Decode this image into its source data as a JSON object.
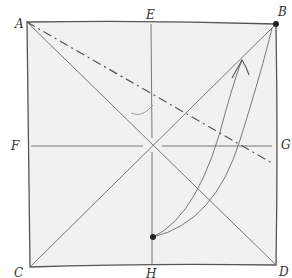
{
  "diagram": {
    "type": "origami-fold-diagram",
    "style": "hand-drawn pencil",
    "colors": {
      "paper_fill": "#f1f1f1",
      "paper_edge": "#555555",
      "crease": "#6a6a6a",
      "dash_line": "#555555",
      "dot": "#222222",
      "label": "#333333"
    },
    "labels": {
      "A": "A",
      "B": "B",
      "C": "C",
      "D": "D",
      "E": "E",
      "F": "F",
      "G": "G",
      "H": "H"
    },
    "points": {
      "A": [
        27,
        22
      ],
      "B": [
        276,
        24
      ],
      "C": [
        30,
        267
      ],
      "D": [
        276,
        265
      ],
      "E": [
        151,
        23
      ],
      "F": [
        29,
        146
      ],
      "G": [
        276,
        146
      ],
      "H": [
        152,
        266
      ],
      "center": [
        152,
        145
      ],
      "moving_dot": [
        153,
        237
      ],
      "dash_end": [
        272,
        163
      ]
    },
    "lines": [
      {
        "name": "diagonal-a-d",
        "from": "A",
        "to": "D",
        "style": "solid-thin"
      },
      {
        "name": "diagonal-b-c",
        "from": "B",
        "to": "C",
        "style": "solid-thin"
      },
      {
        "name": "vertical-e-h",
        "from": "E",
        "to": "H",
        "style": "solid-thin"
      },
      {
        "name": "horizontal-f-g",
        "from": "F",
        "to": "G",
        "style": "solid-thin"
      },
      {
        "name": "fold-line",
        "from": "A",
        "to": "dash_end",
        "style": "dash-dot"
      }
    ],
    "arrow": {
      "description": "curved arrow from dot near H to corner B",
      "from": "moving_dot",
      "to": "B"
    }
  }
}
